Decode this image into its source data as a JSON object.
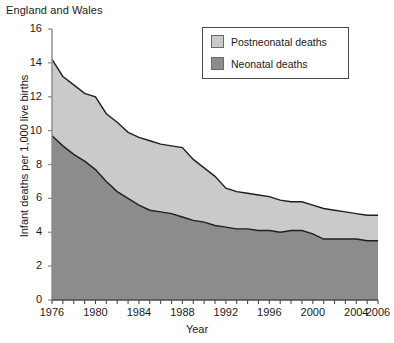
{
  "chart_data": {
    "type": "area",
    "stacked": true,
    "title": "England and Wales",
    "xlabel": "Year",
    "ylabel": "Infant deaths per 1,000 live births",
    "xlim": [
      1976,
      2006
    ],
    "ylim": [
      0,
      16
    ],
    "ytick_step": 2,
    "yticks": [
      0,
      2,
      4,
      6,
      8,
      10,
      12,
      14,
      16
    ],
    "xticks": [
      1976,
      1980,
      1984,
      1988,
      1992,
      1996,
      2000,
      2004,
      2006
    ],
    "xtick_all_years": [
      1976,
      1977,
      1978,
      1979,
      1980,
      1981,
      1982,
      1983,
      1984,
      1985,
      1986,
      1987,
      1988,
      1989,
      1990,
      1991,
      1992,
      1993,
      1994,
      1995,
      1996,
      1997,
      1998,
      1999,
      2000,
      2001,
      2002,
      2003,
      2004,
      2005,
      2006
    ],
    "grid": false,
    "legend_position": "top-right",
    "x": [
      1976,
      1977,
      1978,
      1979,
      1980,
      1981,
      1982,
      1983,
      1984,
      1985,
      1986,
      1987,
      1988,
      1989,
      1990,
      1991,
      1992,
      1993,
      1994,
      1995,
      1996,
      1997,
      1998,
      1999,
      2000,
      2001,
      2002,
      2003,
      2004,
      2005,
      2006
    ],
    "series": [
      {
        "name": "Neonatal deaths",
        "color": "#8c8c8c",
        "values": [
          9.7,
          9.1,
          8.6,
          8.2,
          7.7,
          7.0,
          6.4,
          6.0,
          5.6,
          5.3,
          5.2,
          5.1,
          4.9,
          4.7,
          4.6,
          4.4,
          4.3,
          4.2,
          4.2,
          4.1,
          4.1,
          4.0,
          4.1,
          4.1,
          3.9,
          3.6,
          3.6,
          3.6,
          3.6,
          3.5,
          3.5
        ]
      },
      {
        "name": "Postneonatal deaths",
        "color": "#cacaca",
        "values": [
          4.5,
          4.1,
          4.1,
          4.0,
          4.3,
          4.0,
          4.1,
          3.9,
          4.0,
          4.1,
          4.0,
          4.0,
          4.1,
          3.6,
          3.2,
          2.9,
          2.3,
          2.2,
          2.1,
          2.1,
          2.0,
          1.9,
          1.7,
          1.7,
          1.7,
          1.8,
          1.7,
          1.6,
          1.5,
          1.5,
          1.5
        ]
      }
    ],
    "totals": [
      14.2,
      13.2,
      12.7,
      12.2,
      12.0,
      11.0,
      10.5,
      9.9,
      9.6,
      9.4,
      9.2,
      9.1,
      9.0,
      8.3,
      7.8,
      7.3,
      6.6,
      6.4,
      6.3,
      6.2,
      6.1,
      5.9,
      5.8,
      5.8,
      5.6,
      5.4,
      5.3,
      5.2,
      5.1,
      5.0,
      5.0
    ],
    "legend": [
      {
        "label": "Postneonatal deaths",
        "color": "#cacaca"
      },
      {
        "label": "Neonatal deaths",
        "color": "#8c8c8c"
      }
    ]
  }
}
